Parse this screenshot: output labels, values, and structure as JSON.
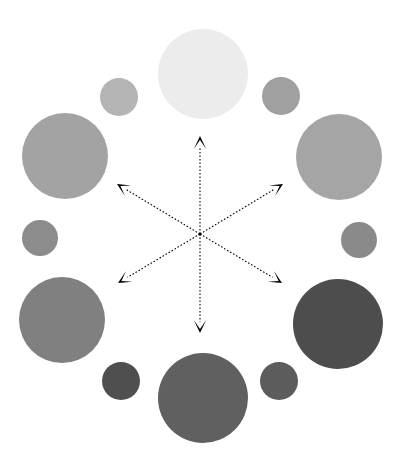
{
  "figure": {
    "title": "",
    "width": 399,
    "height": 464,
    "background_color": "#ffffff"
  },
  "chart_data": {
    "type": "scatter",
    "title": "",
    "subtitle": "",
    "xlabel": "",
    "ylabel": "",
    "grid": false,
    "legend": false,
    "axes_visible": false,
    "xlim": [
      0,
      399
    ],
    "ylim": [
      0,
      464
    ],
    "center": {
      "x": 200,
      "y": 234
    },
    "encoding": {
      "position": "angle around center",
      "size": "circle radius (px)",
      "color": "gray level, light at top to dark at bottom"
    },
    "series": [
      {
        "name": "large-circles",
        "points": [
          {
            "id": "large-top",
            "label": "top",
            "angle_deg": 90,
            "x": 203,
            "y": 74,
            "r": 45,
            "color": "#ececec"
          },
          {
            "id": "large-upper-left",
            "label": "upper-left",
            "angle_deg": 150,
            "x": 65,
            "y": 156,
            "r": 43,
            "color": "#a3a3a3"
          },
          {
            "id": "large-upper-right",
            "label": "upper-right",
            "angle_deg": 30,
            "x": 339,
            "y": 157,
            "r": 43,
            "color": "#a5a5a5"
          },
          {
            "id": "large-lower-left",
            "label": "lower-left",
            "angle_deg": 210,
            "x": 62,
            "y": 320,
            "r": 43,
            "color": "#808080"
          },
          {
            "id": "large-lower-right",
            "label": "lower-right",
            "angle_deg": 330,
            "x": 338,
            "y": 324,
            "r": 45,
            "color": "#4d4d4d"
          },
          {
            "id": "large-bottom",
            "label": "bottom",
            "angle_deg": 270,
            "x": 203,
            "y": 398,
            "r": 45,
            "color": "#606060"
          }
        ]
      },
      {
        "name": "small-circles",
        "points": [
          {
            "id": "small-top-left",
            "label": "top-left",
            "angle_deg": 120,
            "x": 119,
            "y": 97,
            "r": 19,
            "color": "#b4b4b4"
          },
          {
            "id": "small-top-right",
            "label": "top-right",
            "angle_deg": 60,
            "x": 281,
            "y": 96,
            "r": 19,
            "color": "#a0a0a0"
          },
          {
            "id": "small-mid-left",
            "label": "middle-left",
            "angle_deg": 180,
            "x": 40,
            "y": 238,
            "r": 18,
            "color": "#8c8c8c"
          },
          {
            "id": "small-mid-right",
            "label": "middle-right",
            "angle_deg": 0,
            "x": 359,
            "y": 240,
            "r": 18,
            "color": "#8a8a8a"
          },
          {
            "id": "small-bottom-left",
            "label": "bottom-left",
            "angle_deg": 240,
            "x": 121,
            "y": 381,
            "r": 19,
            "color": "#4f4f4f"
          },
          {
            "id": "small-bottom-right",
            "label": "bottom-right",
            "angle_deg": 300,
            "x": 279,
            "y": 381,
            "r": 19,
            "color": "#5c5c5c"
          }
        ]
      }
    ],
    "arrows": {
      "style": "dotted",
      "color": "#000000",
      "line_width": 1,
      "head": "filled-triangle",
      "origin": {
        "x": 200,
        "y": 234
      },
      "rays": [
        {
          "id": "ray-up",
          "label": "up",
          "angle_deg": 90,
          "tip_x": 200,
          "tip_y": 136
        },
        {
          "id": "ray-upper-left",
          "label": "upper-left",
          "angle_deg": 150,
          "tip_x": 117,
          "tip_y": 184
        },
        {
          "id": "ray-upper-right",
          "label": "upper-right",
          "angle_deg": 30,
          "tip_x": 283,
          "tip_y": 184
        },
        {
          "id": "ray-lower-left",
          "label": "lower-left",
          "angle_deg": 210,
          "tip_x": 118,
          "tip_y": 283
        },
        {
          "id": "ray-lower-right",
          "label": "lower-right",
          "angle_deg": 330,
          "tip_x": 282,
          "tip_y": 283
        },
        {
          "id": "ray-down",
          "label": "down",
          "angle_deg": 270,
          "tip_x": 200,
          "tip_y": 333
        }
      ]
    }
  }
}
